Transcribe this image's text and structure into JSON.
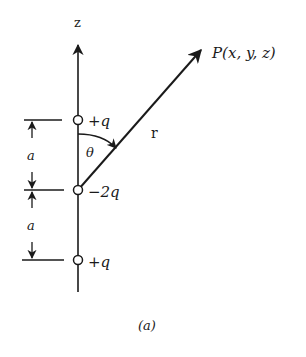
{
  "diagram": {
    "axis_label": "z",
    "point_label": "P(x, y, z)",
    "vector_label": "r",
    "angle_label": "θ",
    "charges": [
      {
        "label": "+q",
        "position": "top"
      },
      {
        "label": "−2q",
        "position": "middle"
      },
      {
        "label": "+q",
        "position": "bottom"
      }
    ],
    "spacing_labels": [
      "a",
      "a"
    ],
    "caption": "(a)",
    "ink_color": "#1a1a1a"
  }
}
